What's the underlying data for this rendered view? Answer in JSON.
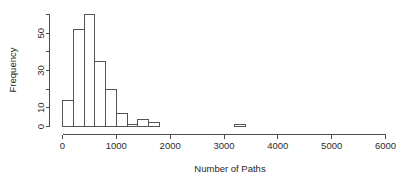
{
  "chart_data": {
    "type": "bar",
    "title": "",
    "subtitle": "",
    "xlabel": "Number of Paths",
    "ylabel": "Frequency",
    "xlim": [
      0,
      6000
    ],
    "ylim": [
      0,
      60
    ],
    "bin_width": 200,
    "grid": false,
    "legend": null,
    "x_ticks": [
      0,
      1000,
      2000,
      3000,
      4000,
      5000,
      6000
    ],
    "x_tick_labels": [
      "0",
      "1000",
      "2000",
      "3000",
      "4000",
      "5000",
      "6000"
    ],
    "y_ticks": [
      0,
      10,
      20,
      30,
      40,
      50,
      60
    ],
    "y_tick_labels": [
      "0",
      "10",
      "",
      "30",
      "",
      "50",
      ""
    ],
    "y_labeled_ticks": [
      0,
      10,
      30,
      50
    ],
    "bins": [
      {
        "start": 0,
        "end": 200,
        "value": 14
      },
      {
        "start": 200,
        "end": 400,
        "value": 52
      },
      {
        "start": 400,
        "end": 600,
        "value": 60
      },
      {
        "start": 600,
        "end": 800,
        "value": 35
      },
      {
        "start": 800,
        "end": 1000,
        "value": 20
      },
      {
        "start": 1000,
        "end": 1200,
        "value": 7
      },
      {
        "start": 1200,
        "end": 1400,
        "value": 1
      },
      {
        "start": 1400,
        "end": 1600,
        "value": 4
      },
      {
        "start": 1600,
        "end": 1800,
        "value": 2
      },
      {
        "start": 3200,
        "end": 3400,
        "value": 1
      }
    ],
    "categories": [
      "0-200",
      "200-400",
      "400-600",
      "600-800",
      "800-1000",
      "1000-1200",
      "1200-1400",
      "1400-1600",
      "1600-1800",
      "3200-3400"
    ],
    "values": [
      14,
      52,
      60,
      35,
      20,
      7,
      1,
      4,
      2,
      1
    ]
  },
  "style": {
    "axis_color": "#4d4d4d",
    "bar_stroke": "#555555",
    "bar_fill": "#ffffff",
    "text_color": "#2b2b2b",
    "background": "#ffffff"
  }
}
